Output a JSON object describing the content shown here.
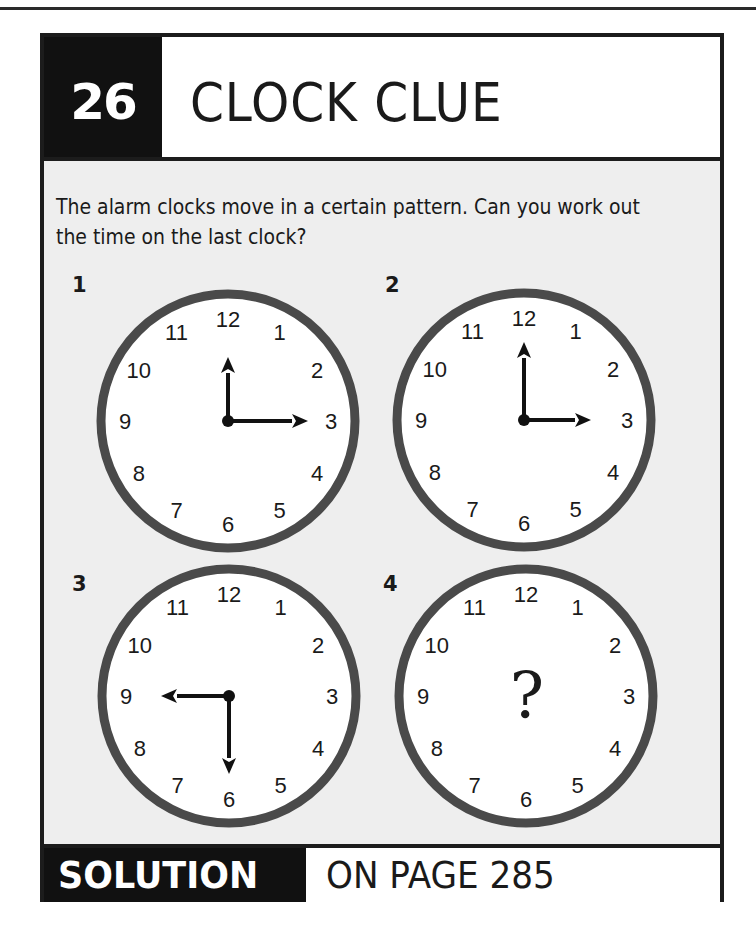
{
  "header": {
    "puzzle_number": "26",
    "title": "CLOCK CLUE"
  },
  "prompt": "The alarm clocks move in a certain pattern. Can you work out the time on the last clock?",
  "clocks": [
    {
      "label": "1",
      "time": "12:15",
      "hour_angle": 0,
      "minute_angle": 90,
      "hour_len": 64,
      "minute_len": 80
    },
    {
      "label": "2",
      "time": "3:00",
      "hour_angle": 90,
      "minute_angle": 0,
      "hour_len": 67,
      "minute_len": 78
    },
    {
      "label": "3",
      "time": "9:30",
      "hour_angle": 270,
      "minute_angle": 180,
      "hour_len": 68,
      "minute_len": 78
    },
    {
      "label": "4",
      "time": "?",
      "unknown_symbol": "?"
    }
  ],
  "dial_numbers": [
    "12",
    "1",
    "2",
    "3",
    "4",
    "5",
    "6",
    "7",
    "8",
    "9",
    "10",
    "11"
  ],
  "footer": {
    "solution_label": "SOLUTION",
    "page_ref": "ON PAGE 285"
  },
  "colors": {
    "ink": "#111111",
    "panel_bg": "#eeeeee",
    "clock_ring": "#4a4a4a",
    "clock_face": "#ffffff"
  }
}
